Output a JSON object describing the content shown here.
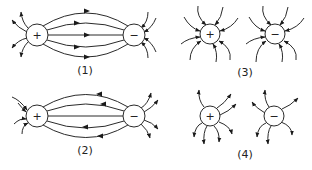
{
  "figure": {
    "panels": [
      {
        "id": "1",
        "label": "(1)",
        "positive_sign": "+",
        "negative_sign": "−",
        "description": "Field lines from + to −, arrows pointing toward − (correct)"
      },
      {
        "id": "2",
        "label": "(2)",
        "positive_sign": "+",
        "negative_sign": "−",
        "description": "Field lines between charges, arrows pointing toward + (reversed)"
      },
      {
        "id": "3",
        "label": "(3)",
        "positive_sign": "+",
        "negative_sign": "−",
        "description": "Both charges with field lines pointing inward"
      },
      {
        "id": "4",
        "label": "(4)",
        "positive_sign": "+",
        "negative_sign": "−",
        "description": "Both charges with field lines pointing outward"
      }
    ]
  }
}
